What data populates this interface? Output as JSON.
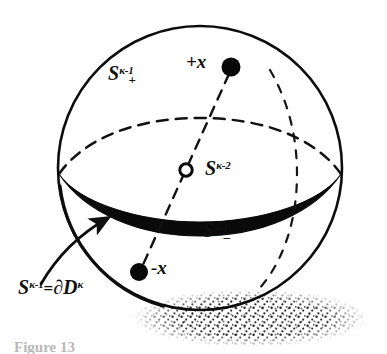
{
  "figure": {
    "background_color": "#ffffff",
    "ink_color": "#101010",
    "width": 387,
    "height": 354
  },
  "labels": {
    "upper_hemisphere": {
      "base": "S",
      "sub": "+",
      "sup": "κ-1",
      "full": "S₊^κ−1"
    },
    "lower_hemisphere": {
      "base": "S",
      "sub": "–",
      "sup": "κ-1",
      "full": "S₋^κ−1"
    },
    "equator": {
      "base": "S",
      "sub": "",
      "sup": "κ-2",
      "full": "S^κ−2"
    },
    "boundary": {
      "base": "S",
      "sup": "κ-1",
      "op": "=",
      "del": "∂",
      "disk": "D",
      "disk_sup": "κ",
      "full": "S^κ−1 = ∂D^κ"
    },
    "point_plus": "+x",
    "point_minus": "-x",
    "caption": "Figure 13"
  },
  "geometry": {
    "sphere": {
      "cx": 200,
      "cy": 168,
      "r": 142
    },
    "equator_label_note": "bold crescent band for front equator, dashed arc for back",
    "points": {
      "plus_x": {
        "x": 231,
        "y": 67,
        "style": "filled-dot"
      },
      "minus_x": {
        "x": 139,
        "y": 272,
        "style": "filled-dot"
      },
      "center": {
        "x": 186,
        "y": 170,
        "style": "open-circle"
      }
    },
    "shadow": {
      "cx": 250,
      "cy": 318,
      "rx": 118,
      "ry": 28,
      "style": "stipple"
    }
  },
  "icons": {
    "arrow": "callout-arrow-icon",
    "filled_dot": "filled-point-icon",
    "open_dot": "open-point-icon"
  }
}
